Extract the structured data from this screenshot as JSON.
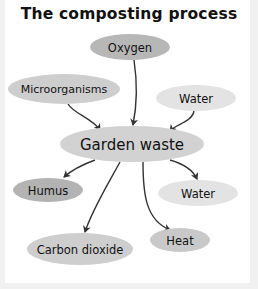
{
  "title": "The composting process",
  "colors": {
    "background": "#f1f1f1",
    "panel": "#ffffff",
    "arrow": "#333333",
    "text": "#111111"
  },
  "diagram": {
    "center": {
      "id": "garden-waste",
      "label": "Garden waste",
      "cx": 132,
      "cy": 144,
      "rx": 72,
      "ry": 18,
      "fill": "#d2d2d2",
      "font_size": 15
    },
    "inputs": [
      {
        "id": "oxygen",
        "label": "Oxygen",
        "cx": 130,
        "cy": 47,
        "rx": 40,
        "ry": 13,
        "fill": "#b7b7b7",
        "font_size": 11.5
      },
      {
        "id": "microorganisms",
        "label": "Microorganisms",
        "cx": 64,
        "cy": 89,
        "rx": 56,
        "ry": 15,
        "fill": "#cecece",
        "font_size": 11
      },
      {
        "id": "water-in",
        "label": "Water",
        "cx": 196,
        "cy": 98,
        "rx": 40,
        "ry": 13,
        "fill": "#e3e3e3",
        "font_size": 11.5
      }
    ],
    "outputs": [
      {
        "id": "humus",
        "label": "Humus",
        "cx": 48,
        "cy": 190,
        "rx": 35,
        "ry": 12,
        "fill": "#b3b3b3",
        "font_size": 11.5
      },
      {
        "id": "water-out",
        "label": "Water",
        "cx": 198,
        "cy": 193,
        "rx": 40,
        "ry": 13,
        "fill": "#e3e3e3",
        "font_size": 11.5
      },
      {
        "id": "heat",
        "label": "Heat",
        "cx": 180,
        "cy": 240,
        "rx": 30,
        "ry": 12,
        "fill": "#c9c9c9",
        "font_size": 11.5
      },
      {
        "id": "carbon-dioxide",
        "label": "Carbon dioxide",
        "cx": 80,
        "cy": 249,
        "rx": 53,
        "ry": 16,
        "fill": "#cecece",
        "font_size": 11.5
      }
    ],
    "edges": [
      {
        "from": "oxygen",
        "to": "garden-waste",
        "path": "M134,60 C137,80 137,105 133,125"
      },
      {
        "from": "microorganisms",
        "to": "garden-waste",
        "path": "M68,104 C74,114 92,118 100,130"
      },
      {
        "from": "water-in",
        "to": "garden-waste",
        "path": "M194,111 C192,122 176,124 170,131"
      },
      {
        "from": "garden-waste",
        "to": "humus",
        "path": "M95,160 C84,164 72,170 64,177"
      },
      {
        "from": "garden-waste",
        "to": "carbon-dioxide",
        "path": "M120,162 C108,184 92,210 85,232"
      },
      {
        "from": "garden-waste",
        "to": "heat",
        "path": "M143,162 C143,195 146,220 170,230"
      },
      {
        "from": "garden-waste",
        "to": "water-out",
        "path": "M170,160 C184,164 193,170 197,179"
      }
    ]
  }
}
